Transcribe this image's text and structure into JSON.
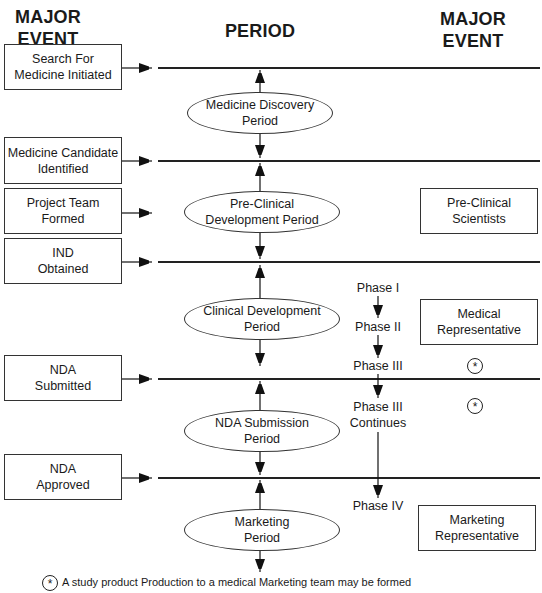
{
  "headers": {
    "left": "MAJOR\nEVENT",
    "left_line1": "MAJOR",
    "left_line2": "EVENT",
    "center": "PERIOD",
    "right_line1": "MAJOR",
    "right_line2": "EVENT"
  },
  "major_events_left": [
    {
      "line1": "Search For",
      "line2": "Medicine Initiated"
    },
    {
      "line1": "Medicine Candidate",
      "line2": "Identified"
    },
    {
      "line1": "Project Team",
      "line2": "Formed"
    },
    {
      "line1": "IND",
      "line2": "Obtained"
    },
    {
      "line1": "NDA",
      "line2": "Submitted"
    },
    {
      "line1": "NDA",
      "line2": "Approved"
    }
  ],
  "periods": [
    {
      "line1": "Medicine Discovery",
      "line2": "Period"
    },
    {
      "line1": "Pre-Clinical",
      "line2": "Development Period"
    },
    {
      "line1": "Clinical Development",
      "line2": "Period"
    },
    {
      "line1": "NDA Submission",
      "line2": "Period"
    },
    {
      "line1": "Marketing",
      "line2": "Period"
    }
  ],
  "phases": [
    {
      "label": "Phase I"
    },
    {
      "label": "Phase II"
    },
    {
      "label": "Phase III"
    },
    {
      "label": "Phase III",
      "label2": "Continues"
    },
    {
      "label": "Phase IV"
    }
  ],
  "major_events_right": [
    {
      "line1": "Pre-Clinical",
      "line2": "Scientists"
    },
    {
      "line1": "Medical",
      "line2": "Representative"
    },
    {
      "line1": "Marketing",
      "line2": "Representative"
    }
  ],
  "markers": {
    "star_symbol": "*"
  },
  "footnote": {
    "symbol": "*",
    "text": "A study product Production to a medical Marketing team may be formed"
  }
}
